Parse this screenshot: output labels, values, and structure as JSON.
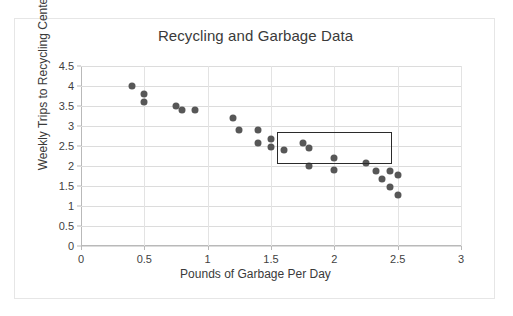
{
  "chart_data": {
    "type": "scatter",
    "title": "Recycling and Garbage Data",
    "xlabel": "Pounds of Garbage Per Day",
    "ylabel": "Weekly Trips to Recycling Center",
    "xlim": [
      0,
      3
    ],
    "ylim": [
      0,
      4.5
    ],
    "xticks": [
      "0",
      "0.5",
      "1",
      "1.5",
      "2",
      "2.5",
      "3"
    ],
    "xtick_values": [
      0,
      0.5,
      1,
      1.5,
      2,
      2.5,
      3
    ],
    "yticks": [
      "0",
      "0.5",
      "1",
      "1.5",
      "2",
      "2.5",
      "3",
      "3.5",
      "4",
      "4.5"
    ],
    "ytick_values": [
      0,
      0.5,
      1,
      1.5,
      2,
      2.5,
      3,
      3.5,
      4,
      4.5
    ],
    "grid": "horizontal-and-vertical",
    "legend": "none",
    "marker_color": "#575757",
    "points": [
      {
        "x": 0.4,
        "y": 4.0
      },
      {
        "x": 0.5,
        "y": 3.8
      },
      {
        "x": 0.5,
        "y": 3.6
      },
      {
        "x": 0.75,
        "y": 3.5
      },
      {
        "x": 0.8,
        "y": 3.4
      },
      {
        "x": 0.9,
        "y": 3.4
      },
      {
        "x": 1.2,
        "y": 3.2
      },
      {
        "x": 1.25,
        "y": 2.9
      },
      {
        "x": 1.4,
        "y": 2.9
      },
      {
        "x": 1.4,
        "y": 2.58
      },
      {
        "x": 1.5,
        "y": 2.68
      },
      {
        "x": 1.5,
        "y": 2.48
      },
      {
        "x": 1.6,
        "y": 2.39
      },
      {
        "x": 1.75,
        "y": 2.58
      },
      {
        "x": 1.8,
        "y": 2.44
      },
      {
        "x": 1.8,
        "y": 1.99
      },
      {
        "x": 2.0,
        "y": 2.19
      },
      {
        "x": 2.0,
        "y": 1.89
      },
      {
        "x": 2.25,
        "y": 2.07
      },
      {
        "x": 2.33,
        "y": 1.88
      },
      {
        "x": 2.38,
        "y": 1.68
      },
      {
        "x": 2.44,
        "y": 1.88
      },
      {
        "x": 2.44,
        "y": 1.48
      },
      {
        "x": 2.5,
        "y": 1.78
      },
      {
        "x": 2.5,
        "y": 1.28
      }
    ],
    "annotations": [
      {
        "type": "rectangle",
        "name": "highlight-box",
        "x0": 1.545,
        "x1": 2.455,
        "y0": 2.06,
        "y1": 2.86,
        "stroke": "#2b2b2b"
      }
    ]
  }
}
